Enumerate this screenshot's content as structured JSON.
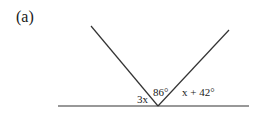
{
  "part_label": "(a)",
  "diagram": {
    "type": "angles-on-a-straight-line",
    "angle_labels": {
      "left": "3x",
      "middle": "86°",
      "right": "x + 42°"
    },
    "colors": {
      "line": "#333333",
      "text": "#1a1a1a",
      "background": "#ffffff"
    }
  }
}
